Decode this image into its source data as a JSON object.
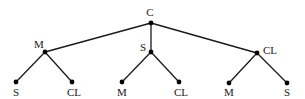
{
  "diagram": {
    "type": "tree",
    "colors": {
      "edge": "#1a1a1a",
      "node": "#000000",
      "label": "#1a1a1a",
      "background": "#ffffff"
    },
    "root": {
      "id": "root",
      "label": "C",
      "x": 151,
      "y": 23,
      "label_x": 150,
      "label_y": 16,
      "label_anchor": "middle"
    },
    "level1": [
      {
        "id": "n1",
        "label": "M",
        "x": 45,
        "y": 52,
        "label_x": 39,
        "label_y": 48,
        "label_anchor": "middle"
      },
      {
        "id": "n2",
        "label": "S",
        "x": 151,
        "y": 52,
        "label_x": 143,
        "label_y": 51,
        "label_anchor": "middle"
      },
      {
        "id": "n3",
        "label": "CL",
        "x": 257,
        "y": 53,
        "label_x": 263,
        "label_y": 54,
        "label_anchor": "start"
      }
    ],
    "leaves": [
      {
        "id": "l1",
        "parent": "n1",
        "label": "S",
        "x": 16,
        "y": 82,
        "label_x": 16,
        "label_y": 96,
        "label_anchor": "middle"
      },
      {
        "id": "l2",
        "parent": "n1",
        "label": "CL",
        "x": 72,
        "y": 82,
        "label_x": 74,
        "label_y": 96,
        "label_anchor": "middle"
      },
      {
        "id": "l3",
        "parent": "n2",
        "label": "M",
        "x": 122,
        "y": 82,
        "label_x": 122,
        "label_y": 96,
        "label_anchor": "middle"
      },
      {
        "id": "l4",
        "parent": "n2",
        "label": "CL",
        "x": 179,
        "y": 82,
        "label_x": 181,
        "label_y": 96,
        "label_anchor": "middle"
      },
      {
        "id": "l5",
        "parent": "n3",
        "label": "M",
        "x": 229,
        "y": 83,
        "label_x": 229,
        "label_y": 96,
        "label_anchor": "middle"
      },
      {
        "id": "l6",
        "parent": "n3",
        "label": "S",
        "x": 287,
        "y": 83,
        "label_x": 287,
        "label_y": 96,
        "label_anchor": "middle"
      }
    ]
  }
}
